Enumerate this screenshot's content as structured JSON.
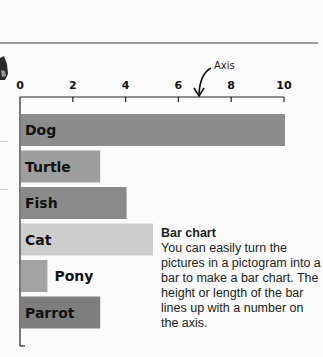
{
  "chart_data": {
    "type": "bar",
    "orientation": "horizontal",
    "title": "",
    "xlabel": "",
    "ylabel": "",
    "xlim": [
      0,
      10
    ],
    "x_ticks": [
      0,
      2,
      4,
      6,
      8,
      10
    ],
    "x_tick_labels": [
      "0",
      "2",
      "4",
      "6",
      "8",
      "10"
    ],
    "categories": [
      "Dog",
      "Turtle",
      "Fish",
      "Cat",
      "Pony",
      "Parrot"
    ],
    "values": [
      10,
      3,
      4,
      5,
      1,
      3
    ],
    "bar_colors": [
      "#8c8c8c",
      "#9e9e9e",
      "#8a8a8a",
      "#cdcdcd",
      "#a3a3a3",
      "#7e7e7e"
    ],
    "annotation": {
      "text": "Axis",
      "points_to": "x-axis"
    },
    "grid": false,
    "legend": "none"
  },
  "caption": {
    "title": "Bar chart",
    "body": "You can easily turn the pictures in a pictogram into a bar to make a bar chart. The height or length of the bar lines up with a number on the axis."
  }
}
